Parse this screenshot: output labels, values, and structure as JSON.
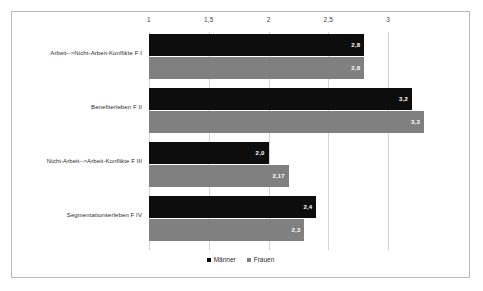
{
  "chart_data": {
    "type": "bar",
    "orientation": "horizontal",
    "title": "",
    "xlabel": "",
    "ylabel": "",
    "xlim": [
      1,
      3.35
    ],
    "grid": true,
    "legend_position": "bottom-center",
    "tick_labels": [
      "1",
      "1,5",
      "2",
      "2,5",
      "3"
    ],
    "ticks": [
      1,
      1.5,
      2,
      2.5,
      3
    ],
    "categories": [
      "Arbeit-->Nicht-Arbeit-Konflikte F I",
      "Benefiterleben F II",
      "Nicht-Arbeit-->Arbeit-Konflikte F III",
      "Segmentationserleben F IV"
    ],
    "series": [
      {
        "name": "Männer",
        "color": "#0d0d0d",
        "values": [
          2.8,
          3.2,
          2.0,
          2.4
        ],
        "labels": [
          "2,8",
          "3,2",
          "2,0",
          "2,4"
        ]
      },
      {
        "name": "Frauen",
        "color": "#808080",
        "values": [
          2.8,
          3.3,
          2.17,
          2.3
        ],
        "labels": [
          "2,8",
          "3,3",
          "2,17",
          "2,3"
        ]
      }
    ]
  }
}
